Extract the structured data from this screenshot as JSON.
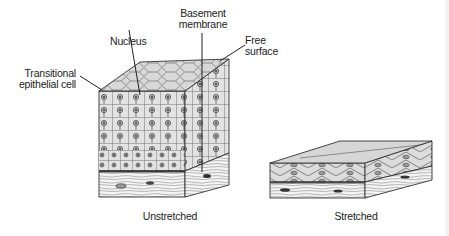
{
  "figure": {
    "labels": {
      "transitional_cell": [
        "Transitional",
        "epithelial cell"
      ],
      "nucleus": "Nucleus",
      "basement_membrane": [
        "Basement",
        "membrane"
      ],
      "free_surface": [
        "Free",
        "surface"
      ]
    },
    "captions": {
      "unstretched": "Unstretched",
      "stretched": "Stretched"
    },
    "colors": {
      "cell_fill": "#e2e2e2",
      "top_fill": "#d6d6d6",
      "line": "#333333",
      "connective": "#f4f4f4",
      "nucleus": "#8a8a8a"
    }
  }
}
